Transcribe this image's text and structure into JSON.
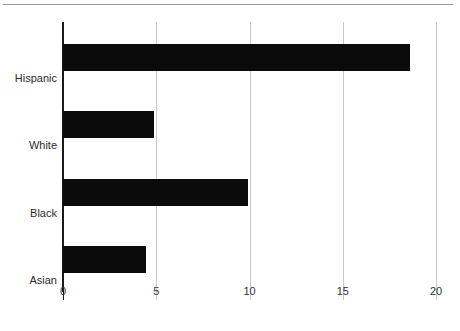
{
  "chart_data": {
    "type": "bar",
    "orientation": "horizontal",
    "title": "",
    "subtitle": "",
    "xlabel": "",
    "ylabel": "",
    "categories": [
      "Hispanic",
      "White",
      "Black",
      "Asian"
    ],
    "values": [
      18.6,
      4.9,
      9.9,
      4.45
    ],
    "series": [
      {
        "name": "",
        "values": [
          18.6,
          4.9,
          9.9,
          4.45
        ]
      }
    ],
    "xlim": [
      0,
      20
    ],
    "xticks": [
      0,
      5,
      10,
      15,
      20
    ],
    "xtick_labels": [
      "0",
      "5",
      "10",
      "15",
      "20"
    ],
    "grid": "vertical",
    "legend": "none",
    "bar_color": "#0b0b0b",
    "gridline_color": "#c9c9c9",
    "axis_color": "#1a1a1a",
    "background_color": "#ffffff",
    "annotations": []
  },
  "figure": {
    "top_rule_color": "#9a9a9a"
  }
}
